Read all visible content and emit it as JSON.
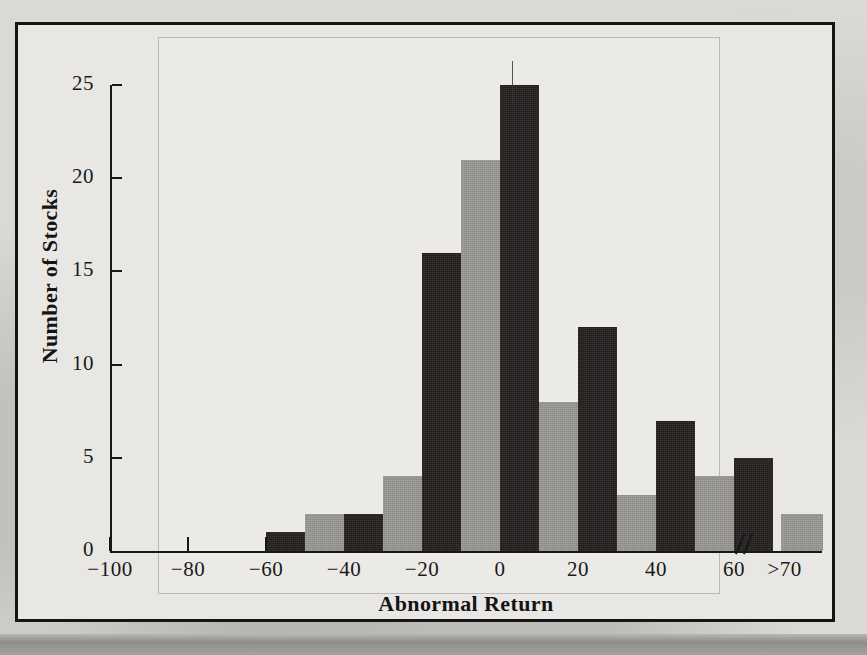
{
  "figure": {
    "frame_color": "#151515",
    "paper_color": "#e9e7e3"
  },
  "chart_data": {
    "type": "bar",
    "title": "",
    "xlabel": "Abnormal Return",
    "ylabel": "Number of Stocks",
    "ylim": [
      0,
      26
    ],
    "yticks": [
      0,
      5,
      10,
      15,
      20,
      25
    ],
    "ytick_labels": [
      "0",
      "5",
      "10",
      "15",
      "20",
      "25"
    ],
    "xticks": [
      -100,
      -80,
      -60,
      -40,
      -20,
      0,
      20,
      40,
      60,
      70
    ],
    "xtick_labels": [
      "−100",
      "−80",
      "−60",
      "−40",
      "−20",
      "0",
      "20",
      "40",
      "60",
      ">70"
    ],
    "grid": false,
    "legend": "none",
    "axis_break": "//",
    "bin_width": 10,
    "categories": [
      "-100 to -90",
      "-90 to -80",
      "-80 to -70",
      "-70 to -60",
      "-60 to -50",
      "-50 to -40",
      "-40 to -30",
      "-30 to -20",
      "-20 to -10",
      "-10 to 0",
      "0 to 10",
      "10 to 20",
      "20 to 30",
      "30 to 40",
      "40 to 50",
      "50 to 60",
      "60 to 70",
      ">70"
    ],
    "values": [
      0,
      0,
      0,
      0,
      1,
      2,
      2,
      4,
      16,
      21,
      25,
      8,
      12,
      3,
      7,
      4,
      5,
      2
    ],
    "bar_colors": [
      "dark",
      "light",
      "dark",
      "light",
      "dark",
      "light",
      "dark",
      "light",
      "dark",
      "light",
      "dark",
      "light",
      "dark",
      "light",
      "dark",
      "light",
      "dark",
      "light"
    ],
    "color_dark": "#221f1d",
    "color_light": "#9a9894"
  }
}
